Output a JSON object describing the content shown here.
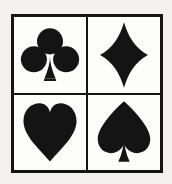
{
  "figure": {
    "name": "playing-card-suit-symbols",
    "background_color": "#f2f1ef",
    "panel_color": "#fdfdfb",
    "ink_color": "#141414",
    "border_color": "#141414",
    "layout": "2x2 grid",
    "columns": 2,
    "rows": 2
  },
  "cells": [
    {
      "position": "top-left",
      "suit": "clubs",
      "icon": "club-icon",
      "symbol": "♣",
      "color": "#141414"
    },
    {
      "position": "top-right",
      "suit": "diamonds",
      "icon": "diamond-icon",
      "symbol": "♦",
      "color": "#141414"
    },
    {
      "position": "bottom-left",
      "suit": "hearts",
      "icon": "heart-icon",
      "symbol": "♥",
      "color": "#141414"
    },
    {
      "position": "bottom-right",
      "suit": "spades",
      "icon": "spade-icon",
      "symbol": "♠",
      "color": "#141414"
    }
  ]
}
